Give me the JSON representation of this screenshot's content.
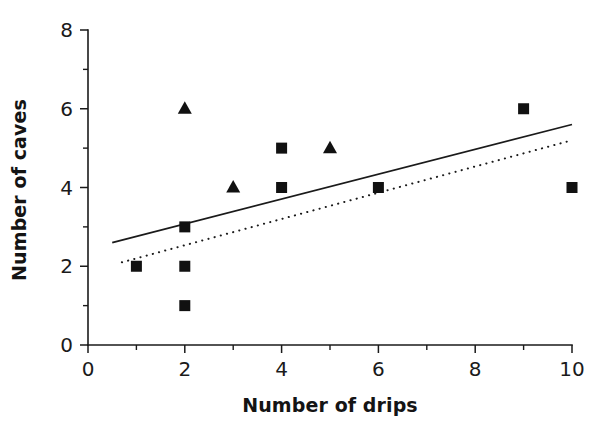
{
  "chart_data": {
    "type": "scatter",
    "title": "",
    "xlabel": "Number of drips",
    "ylabel": "Number of caves",
    "xlim": [
      0,
      10
    ],
    "ylim": [
      0,
      8
    ],
    "xticks": [
      0,
      2,
      4,
      6,
      8,
      10
    ],
    "yticks": [
      0,
      2,
      4,
      6,
      8
    ],
    "xticklabels": [
      "0",
      "2",
      "4",
      "6",
      "8",
      "10"
    ],
    "yticklabels": [
      "0",
      "2",
      "4",
      "6",
      "8"
    ],
    "xminorticks": [
      1,
      3,
      5,
      7,
      9
    ],
    "yminorticks": [
      1,
      3,
      5,
      7
    ],
    "grid": false,
    "legend": "none",
    "marker_color": "#111111",
    "axis_color": "#1a1a1a",
    "series": [
      {
        "name": "squares",
        "marker": "square",
        "points": [
          {
            "x": 1,
            "y": 2
          },
          {
            "x": 2,
            "y": 3
          },
          {
            "x": 2,
            "y": 2
          },
          {
            "x": 2,
            "y": 1
          },
          {
            "x": 4,
            "y": 5
          },
          {
            "x": 4,
            "y": 4
          },
          {
            "x": 6,
            "y": 4
          },
          {
            "x": 9,
            "y": 6
          },
          {
            "x": 10,
            "y": 4
          }
        ]
      },
      {
        "name": "triangles",
        "marker": "triangle",
        "points": [
          {
            "x": 2,
            "y": 6
          },
          {
            "x": 3,
            "y": 4
          },
          {
            "x": 5,
            "y": 5
          }
        ]
      }
    ],
    "trendlines": [
      {
        "name": "solid-fit-line",
        "style": "solid",
        "x0": 0.5,
        "y0": 2.6,
        "x1": 10.0,
        "y1": 5.6
      },
      {
        "name": "dotted-fit-line",
        "style": "dotted",
        "x0": 0.7,
        "y0": 2.1,
        "x1": 10.0,
        "y1": 5.2
      }
    ]
  }
}
